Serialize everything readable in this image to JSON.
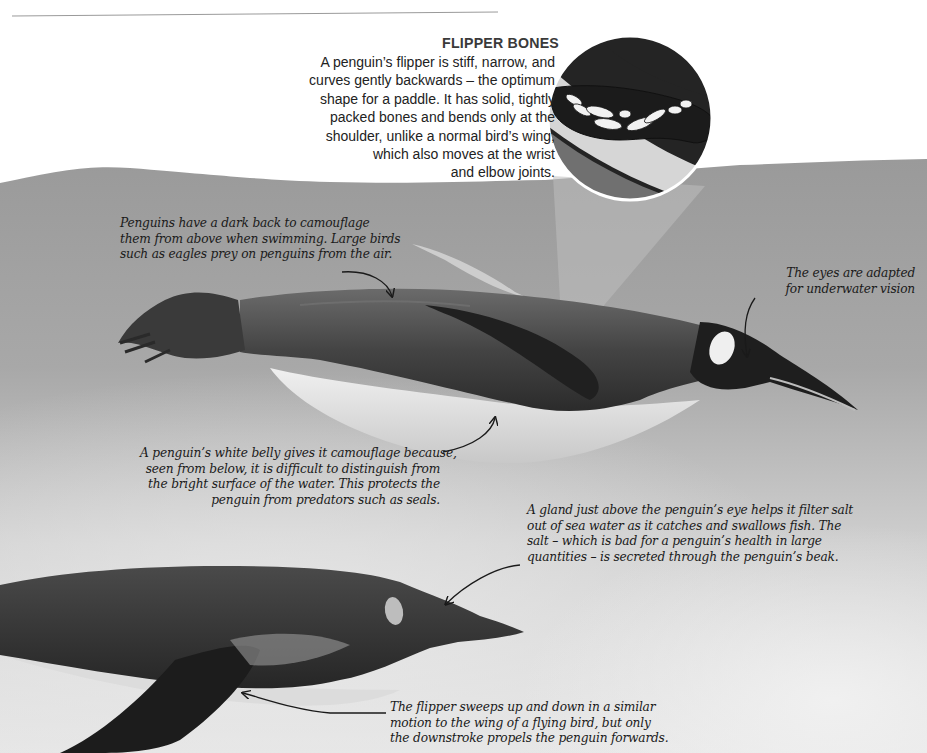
{
  "colors": {
    "page_bg": "#ffffff",
    "water_light": "#c9c9c9",
    "water_mid": "#a5a5a5",
    "water_dark": "#8d8d8d",
    "penguin_back": "#3b3b3b",
    "penguin_belly": "#e4e4e4",
    "magnifier_dark": "#222222",
    "magnifier_light": "#d8d8d8",
    "magnifier_band": "#6e6e6e",
    "bones": "#f2f2f2",
    "text": "#1a1a1a"
  },
  "flipper_bones": {
    "title": "FLIPPER BONES",
    "lines": [
      "A penguin’s flipper is stiff, narrow, and",
      "curves gently backwards – the optimum",
      "shape for a paddle. It has solid, tightly",
      "packed bones and bends only at the",
      "shoulder, unlike a normal bird’s wing,",
      "which also moves at the wrist",
      "and elbow joints."
    ],
    "icon": "flipper-skeleton-magnifier-icon"
  },
  "annotations": {
    "dark_back": {
      "lines": [
        "Penguins have a dark back to camouflage",
        "them from above when swimming. Large birds",
        "such as eagles prey on penguins from the air."
      ]
    },
    "eyes": {
      "lines": [
        "The eyes are adapted",
        "for underwater vision"
      ]
    },
    "white_belly": {
      "lines": [
        "A penguin’s white belly gives it camouflage because,",
        "seen from below, it is difficult to distinguish from",
        "the bright surface of the water. This protects the",
        "penguin from predators such as seals."
      ]
    },
    "salt_gland": {
      "lines": [
        "A gland just above the penguin’s eye helps it filter salt",
        "out of sea water as it catches and swallows fish. The",
        "salt – which is bad for a penguin’s health in large",
        "quantities – is secreted through the penguin’s beak."
      ]
    },
    "flipper_motion": {
      "lines": [
        "The flipper sweeps up and down in a similar",
        "motion to the wing of a flying bird, but only",
        "the downstroke propels the penguin forwards."
      ]
    }
  }
}
